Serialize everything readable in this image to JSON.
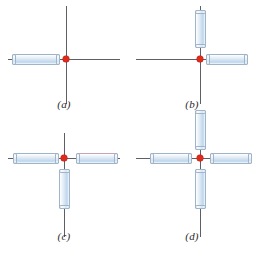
{
  "figure": {
    "background_color": "#ffffff",
    "axis_color": "#5c5f66",
    "center_marker_color": "#e02b1c",
    "rod_fill_color": "#cddff0",
    "rod_border_color": "#9fb4c9",
    "rod_tint_color": "#c9a3b4"
  },
  "panels": [
    {
      "id": "panel-a",
      "label": "(a)",
      "rod_count": 1,
      "rods": [
        "left"
      ]
    },
    {
      "id": "panel-b",
      "label": "(b)",
      "rod_count": 2,
      "rods": [
        "up",
        "right"
      ]
    },
    {
      "id": "panel-c",
      "label": "(c)",
      "rod_count": 3,
      "rods": [
        "left",
        "right",
        "down"
      ]
    },
    {
      "id": "panel-d",
      "label": "(d)",
      "rod_count": 4,
      "rods": [
        "left",
        "right",
        "up",
        "down"
      ]
    }
  ]
}
